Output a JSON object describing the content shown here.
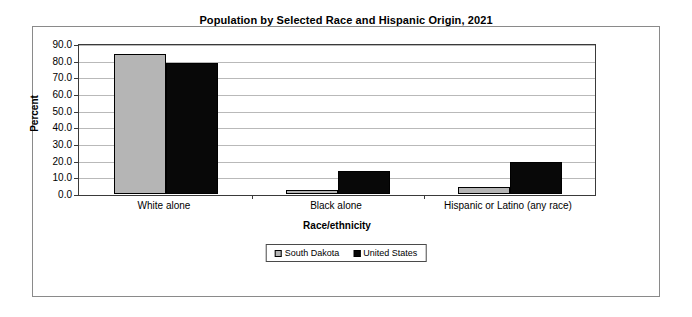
{
  "chart_data": {
    "type": "bar",
    "title": "Population by Selected Race and Hispanic Origin, 2021",
    "xlabel": "Race/ethnicity",
    "ylabel": "Percent",
    "categories": [
      "White alone",
      "Black alone",
      "Hispanic or Latino (any race)"
    ],
    "series": [
      {
        "name": "South Dakota",
        "color": "#b5b5b5",
        "values": [
          84.0,
          2.3,
          4.5
        ]
      },
      {
        "name": "United States",
        "color": "#080808",
        "values": [
          78.8,
          13.6,
          19.5
        ]
      }
    ],
    "ylim": [
      0.0,
      90.0
    ],
    "ytick_step": 10.0,
    "ytick_labels": [
      "90.0",
      "80.0",
      "70.0",
      "60.0",
      "50.0",
      "40.0",
      "30.0",
      "20.0",
      "10.0",
      "0.0"
    ],
    "grid": "horizontal",
    "legend_position": "bottom-center"
  },
  "legend": {
    "entries": [
      {
        "label": "South Dakota"
      },
      {
        "label": "United States"
      }
    ]
  }
}
